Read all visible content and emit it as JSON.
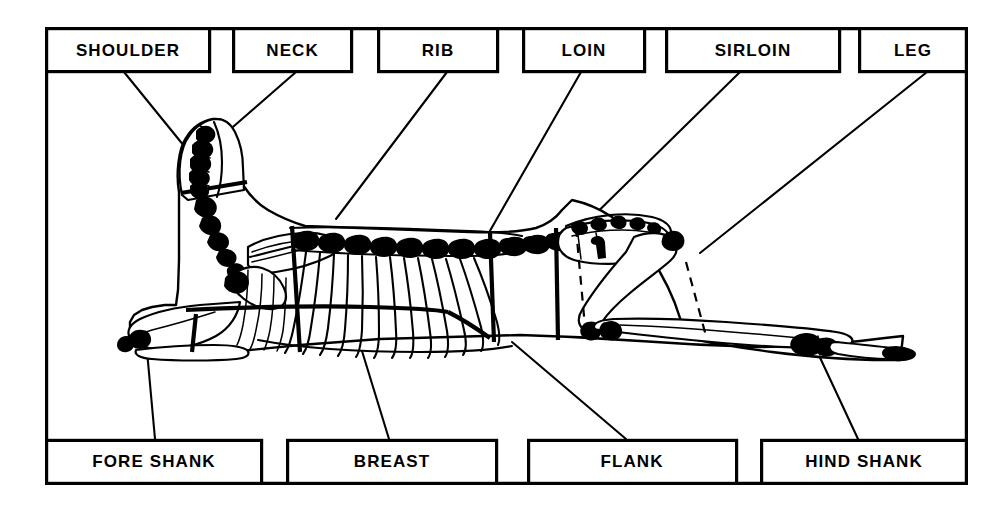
{
  "diagram": {
    "frame": {
      "stroke_color": "#000000",
      "background_color": "#ffffff"
    },
    "top_labels": [
      {
        "id": "shoulder",
        "label": "SHOULDER",
        "box": {
          "x": 45,
          "y": 27,
          "w": 165,
          "h": 44
        },
        "leader": {
          "x1": 124,
          "y1": 71,
          "x2": 230,
          "y2": 200
        }
      },
      {
        "id": "neck",
        "label": "NECK",
        "box": {
          "x": 232,
          "y": 27,
          "w": 120,
          "h": 44
        },
        "leader": {
          "x1": 295,
          "y1": 71,
          "x2": 228,
          "y2": 131
        }
      },
      {
        "id": "rib",
        "label": "RIB",
        "box": {
          "x": 377,
          "y": 27,
          "w": 121,
          "h": 44
        },
        "leader": {
          "x1": 448,
          "y1": 71,
          "x2": 335,
          "y2": 218
        }
      },
      {
        "id": "loin",
        "label": "LOIN",
        "box": {
          "x": 522,
          "y": 27,
          "w": 123,
          "h": 44
        },
        "leader": {
          "x1": 582,
          "y1": 71,
          "x2": 483,
          "y2": 243
        }
      },
      {
        "id": "sirloin",
        "label": "SIRLOIN",
        "box": {
          "x": 665,
          "y": 27,
          "w": 175,
          "h": 44
        },
        "leader": {
          "x1": 740,
          "y1": 71,
          "x2": 570,
          "y2": 236
        }
      },
      {
        "id": "leg",
        "label": "LEG",
        "box": {
          "x": 858,
          "y": 27,
          "w": 110,
          "h": 44
        },
        "leader": {
          "x1": 928,
          "y1": 71,
          "x2": 700,
          "y2": 254
        }
      }
    ],
    "bottom_labels": [
      {
        "id": "fore-shank",
        "label": "FORE SHANK",
        "box": {
          "x": 45,
          "y": 440,
          "w": 217,
          "h": 45
        },
        "leader": {
          "x1": 155,
          "y1": 440,
          "x2": 148,
          "y2": 350
        }
      },
      {
        "id": "breast",
        "label": "BREAST",
        "box": {
          "x": 286,
          "y": 440,
          "w": 211,
          "h": 45
        },
        "leader": {
          "x1": 388,
          "y1": 440,
          "x2": 362,
          "y2": 352
        }
      },
      {
        "id": "flank",
        "label": "FLANK",
        "box": {
          "x": 527,
          "y": 440,
          "w": 210,
          "h": 45
        },
        "leader": {
          "x1": 625,
          "y1": 440,
          "x2": 512,
          "y2": 343
        }
      },
      {
        "id": "hind-shank",
        "label": "HIND SHANK",
        "box": {
          "x": 760,
          "y": 440,
          "w": 208,
          "h": 45
        },
        "leader": {
          "x1": 858,
          "y1": 440,
          "x2": 815,
          "y2": 350
        }
      }
    ],
    "cut_lines": [
      {
        "id": "neck-shoulder-break",
        "type": "solid",
        "note": "separates neck from shoulder at base of neck vertebrae"
      },
      {
        "id": "shoulder-rib-break",
        "type": "solid",
        "note": "vertical line behind shoulder blade separating shoulder from rib"
      },
      {
        "id": "rib-loin-break",
        "type": "solid",
        "note": "vertical line at last rib separating rib from loin"
      },
      {
        "id": "loin-sirloin-break",
        "type": "solid",
        "note": "vertical line at hip separating loin from sirloin"
      },
      {
        "id": "sirloin-leg-break",
        "type": "dashed",
        "note": "dashed line through the hip separating sirloin from leg"
      },
      {
        "id": "leg-hind-shank-break",
        "type": "dashed",
        "note": "dashed line at stifle joint separating leg from hind shank"
      },
      {
        "id": "breast-rib-break",
        "type": "solid",
        "note": "horizontal line across the ribs separating breast from rib"
      },
      {
        "id": "fore-shank-break",
        "type": "solid",
        "note": "line separating fore shank from shoulder/breast"
      }
    ]
  }
}
